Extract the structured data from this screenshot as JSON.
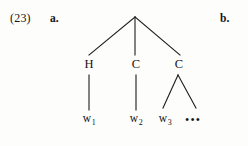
{
  "example": {
    "number": "(23)",
    "sub_labels": [
      {
        "id": "a",
        "text": "a."
      },
      {
        "id": "b",
        "text": "b."
      }
    ]
  },
  "tree": {
    "root": {
      "label": "",
      "x": 135,
      "y": 16
    },
    "nodes": [
      {
        "id": "h",
        "label": "H",
        "x": 89,
        "y": 63
      },
      {
        "id": "c1",
        "label": "C",
        "x": 136,
        "y": 63
      },
      {
        "id": "c2",
        "label": "C",
        "x": 179,
        "y": 63
      }
    ],
    "terminals": [
      {
        "id": "w1",
        "base": "w",
        "sub": "1",
        "x": 89,
        "y": 118
      },
      {
        "id": "w2",
        "base": "w",
        "sub": "2",
        "x": 136,
        "y": 118
      },
      {
        "id": "w3",
        "base": "w",
        "sub": "3",
        "x": 165,
        "y": 118
      }
    ],
    "ellipsis": {
      "text": "•••",
      "x": 195,
      "y": 118
    },
    "edges": [
      {
        "from": "root",
        "to": "h",
        "x1": 135,
        "y1": 17,
        "x2": 89,
        "y2": 55
      },
      {
        "from": "root",
        "to": "c1",
        "x1": 135,
        "y1": 17,
        "x2": 135,
        "y2": 55
      },
      {
        "from": "root",
        "to": "c2",
        "x1": 135,
        "y1": 17,
        "x2": 180,
        "y2": 55
      },
      {
        "from": "h",
        "to": "w1",
        "x1": 89,
        "y1": 75,
        "x2": 89,
        "y2": 110
      },
      {
        "from": "c1",
        "to": "w2",
        "x1": 136,
        "y1": 75,
        "x2": 136,
        "y2": 110
      },
      {
        "from": "c2",
        "to": "w3",
        "x1": 178,
        "y1": 75,
        "x2": 163,
        "y2": 108
      },
      {
        "from": "c2",
        "to": "ellipsis",
        "x1": 178,
        "y1": 75,
        "x2": 196,
        "y2": 108
      }
    ],
    "stroke_color": "#1c1c1c",
    "stroke_width": 1.1
  },
  "page": {
    "background_color": "#fdfdfb"
  }
}
